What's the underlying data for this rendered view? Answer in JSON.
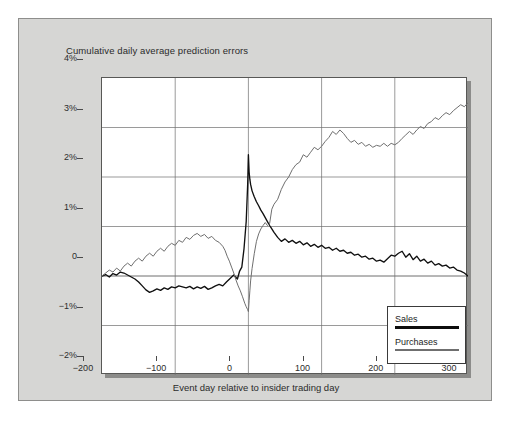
{
  "chart_data": {
    "type": "line",
    "title": "Cumulative daily average prediction errors",
    "xlabel": "Event day relative to insider trading day",
    "ylabel": "",
    "xlim": [
      -200,
      300
    ],
    "ylim": [
      -2,
      4
    ],
    "grid": true,
    "legend_position": "bottom-right",
    "xticks": [
      -200,
      -100,
      0,
      100,
      200,
      300
    ],
    "xticklabels": [
      "−200",
      "−100",
      "0",
      "100",
      "200",
      "300"
    ],
    "yticks": [
      -2,
      -1,
      0,
      1,
      2,
      3,
      4
    ],
    "yticklabels": [
      "−2%",
      "−1%",
      "0",
      "1%",
      "2%",
      "3%",
      "4%"
    ],
    "units": "percent",
    "series": [
      {
        "name": "Sales",
        "color": "#0d0d0d",
        "linewidth": 2.6,
        "x": [
          -200,
          -195,
          -190,
          -185,
          -180,
          -175,
          -170,
          -165,
          -160,
          -155,
          -150,
          -145,
          -140,
          -135,
          -130,
          -125,
          -120,
          -115,
          -110,
          -105,
          -100,
          -95,
          -90,
          -85,
          -80,
          -75,
          -70,
          -65,
          -60,
          -55,
          -50,
          -45,
          -40,
          -35,
          -30,
          -25,
          -20,
          -15,
          -12,
          -9,
          -6,
          -3,
          -1,
          0,
          1,
          2,
          3,
          5,
          8,
          11,
          14,
          17,
          20,
          23,
          26,
          29,
          32,
          35,
          40,
          45,
          50,
          55,
          60,
          65,
          70,
          75,
          80,
          85,
          90,
          95,
          100,
          105,
          110,
          115,
          120,
          125,
          130,
          135,
          140,
          145,
          150,
          155,
          160,
          165,
          170,
          175,
          180,
          185,
          190,
          195,
          200,
          205,
          210,
          215,
          220,
          225,
          230,
          235,
          240,
          245,
          250,
          255,
          260,
          265,
          270,
          275,
          280,
          285,
          290,
          295,
          300
        ],
        "values": [
          0.0,
          0.03,
          -0.02,
          0.05,
          0.02,
          0.08,
          0.06,
          0.02,
          -0.02,
          -0.06,
          -0.12,
          -0.2,
          -0.28,
          -0.33,
          -0.3,
          -0.26,
          -0.29,
          -0.24,
          -0.27,
          -0.22,
          -0.24,
          -0.2,
          -0.22,
          -0.24,
          -0.21,
          -0.26,
          -0.22,
          -0.25,
          -0.21,
          -0.27,
          -0.24,
          -0.2,
          -0.17,
          -0.2,
          -0.12,
          -0.05,
          0.02,
          -0.06,
          0.1,
          0.18,
          0.55,
          1.1,
          1.85,
          2.45,
          2.1,
          1.95,
          1.85,
          1.72,
          1.6,
          1.5,
          1.42,
          1.33,
          1.26,
          1.18,
          1.1,
          1.02,
          0.95,
          0.88,
          0.78,
          0.7,
          0.75,
          0.68,
          0.72,
          0.66,
          0.7,
          0.63,
          0.67,
          0.6,
          0.64,
          0.58,
          0.62,
          0.56,
          0.58,
          0.52,
          0.56,
          0.5,
          0.52,
          0.46,
          0.48,
          0.42,
          0.44,
          0.38,
          0.4,
          0.34,
          0.36,
          0.3,
          0.32,
          0.28,
          0.35,
          0.42,
          0.4,
          0.46,
          0.5,
          0.38,
          0.45,
          0.33,
          0.4,
          0.3,
          0.34,
          0.26,
          0.3,
          0.22,
          0.25,
          0.2,
          0.22,
          0.16,
          0.18,
          0.12,
          0.1,
          0.06,
          0.0
        ]
      },
      {
        "name": "Purchases",
        "color": "#6f6f6f",
        "linewidth": 1.6,
        "x": [
          -200,
          -195,
          -190,
          -185,
          -180,
          -175,
          -170,
          -165,
          -160,
          -155,
          -150,
          -145,
          -140,
          -135,
          -130,
          -125,
          -120,
          -115,
          -110,
          -105,
          -100,
          -95,
          -90,
          -85,
          -80,
          -75,
          -70,
          -65,
          -60,
          -55,
          -50,
          -45,
          -40,
          -35,
          -32,
          -29,
          -26,
          -23,
          -20,
          -17,
          -14,
          -11,
          -8,
          -5,
          -3,
          -1,
          0,
          1,
          2,
          3,
          5,
          8,
          11,
          14,
          17,
          20,
          23,
          26,
          29,
          32,
          35,
          40,
          45,
          50,
          55,
          60,
          65,
          70,
          75,
          80,
          85,
          90,
          95,
          100,
          105,
          110,
          115,
          120,
          125,
          130,
          135,
          140,
          145,
          150,
          155,
          160,
          165,
          170,
          175,
          180,
          185,
          190,
          195,
          200,
          205,
          210,
          215,
          220,
          225,
          230,
          235,
          240,
          245,
          250,
          255,
          260,
          265,
          270,
          275,
          280,
          285,
          290,
          295,
          300
        ],
        "values": [
          0.0,
          0.06,
          0.12,
          0.08,
          0.16,
          0.1,
          0.2,
          0.26,
          0.2,
          0.3,
          0.36,
          0.3,
          0.4,
          0.46,
          0.4,
          0.5,
          0.56,
          0.5,
          0.6,
          0.66,
          0.62,
          0.72,
          0.68,
          0.78,
          0.74,
          0.82,
          0.86,
          0.8,
          0.84,
          0.76,
          0.8,
          0.72,
          0.68,
          0.6,
          0.52,
          0.4,
          0.3,
          0.18,
          0.06,
          -0.08,
          -0.2,
          -0.3,
          -0.42,
          -0.55,
          -0.62,
          -0.68,
          -0.72,
          -0.5,
          -0.3,
          -0.1,
          0.15,
          0.45,
          0.7,
          0.85,
          0.95,
          1.02,
          1.08,
          1.02,
          1.06,
          1.35,
          1.45,
          1.55,
          1.75,
          1.9,
          2.0,
          2.15,
          2.25,
          2.3,
          2.45,
          2.4,
          2.5,
          2.6,
          2.55,
          2.62,
          2.72,
          2.8,
          2.92,
          2.86,
          2.95,
          2.88,
          2.78,
          2.7,
          2.74,
          2.66,
          2.7,
          2.62,
          2.66,
          2.6,
          2.64,
          2.62,
          2.68,
          2.62,
          2.68,
          2.65,
          2.7,
          2.78,
          2.85,
          2.92,
          2.86,
          2.95,
          3.02,
          2.98,
          3.08,
          3.12,
          3.2,
          3.16,
          3.24,
          3.3,
          3.26,
          3.34,
          3.4,
          3.46,
          3.42,
          3.5
        ]
      }
    ]
  },
  "legend": {
    "items": [
      {
        "label": "Sales",
        "style": "sales"
      },
      {
        "label": "Purchases",
        "style": "purchases"
      }
    ]
  }
}
